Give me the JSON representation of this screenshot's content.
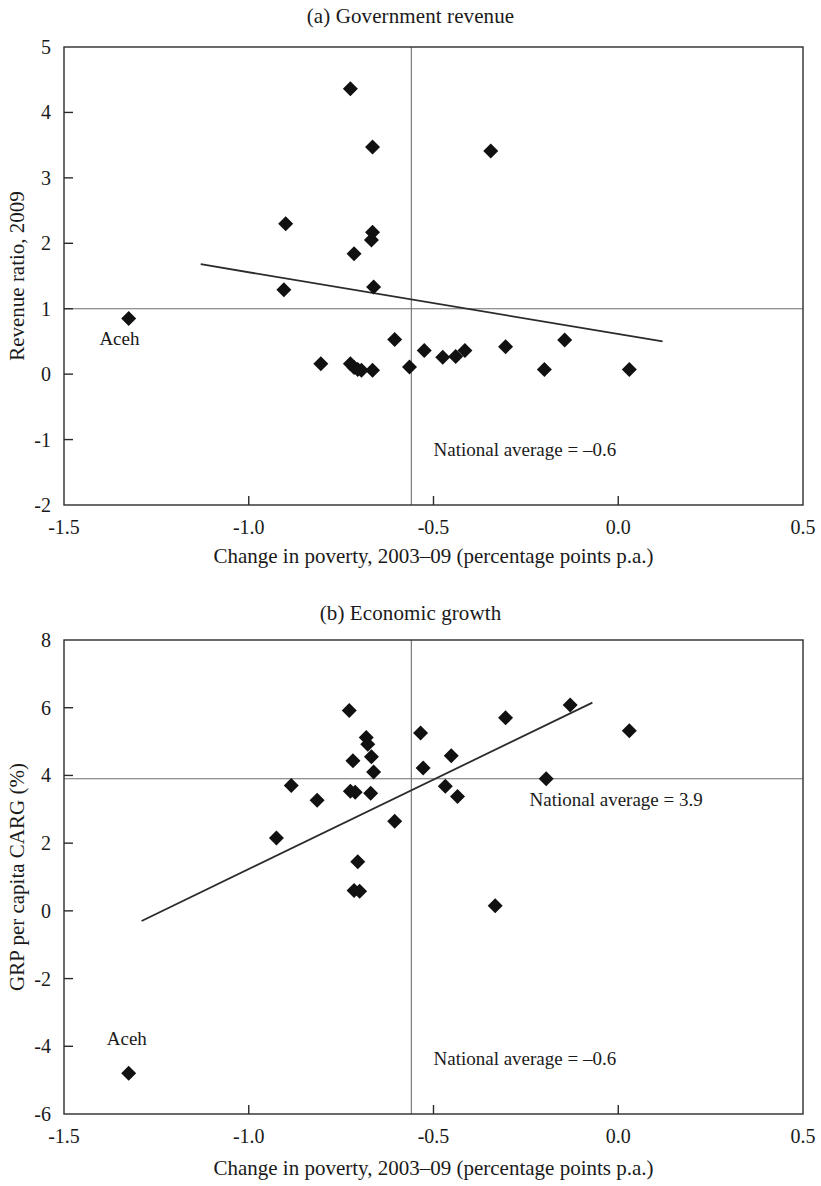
{
  "figure": {
    "panels": [
      {
        "key": "a",
        "title": "(a) Government revenue",
        "aceh_label": "Aceh",
        "vline_annotation": "National average = –0.6",
        "hline_annotation": ""
      },
      {
        "key": "b",
        "title": "(b) Economic growth",
        "aceh_label": "Aceh",
        "vline_annotation": "National average = –0.6",
        "hline_annotation": "National average = 3.9"
      }
    ]
  },
  "chart_data": [
    {
      "type": "scatter",
      "panel": "a",
      "title": "(a) Government revenue",
      "xlabel": "Change in poverty, 2003–09 (percentage points p.a.)",
      "ylabel": "Revenue ratio, 2009",
      "xlim": [
        -1.5,
        0.5
      ],
      "ylim": [
        -2,
        5
      ],
      "xticks": [
        -1.5,
        -1.0,
        -0.5,
        0.0,
        0.5
      ],
      "xticklabels": [
        "-1.5",
        "-1.0",
        "-0.5",
        "0.0",
        "0.5"
      ],
      "yticks": [
        -2,
        -1,
        0,
        1,
        2,
        3,
        4,
        5
      ],
      "yticklabels": [
        "-2",
        "-1",
        "0",
        "1",
        "2",
        "3",
        "4",
        "5"
      ],
      "grid": false,
      "legend": null,
      "hline": {
        "value": 1.0,
        "label": ""
      },
      "vline": {
        "value": -0.56,
        "label": "National average = –0.6"
      },
      "trendline": {
        "x": [
          -1.13,
          0.12
        ],
        "y": [
          1.68,
          0.5
        ]
      },
      "annotations": [
        {
          "text": "National average = –0.6",
          "x": -0.5,
          "y": -1.25
        },
        {
          "text": "Aceh",
          "x": -1.35,
          "y": 0.45
        }
      ],
      "points": [
        {
          "x": -1.325,
          "y": 0.85,
          "label": "Aceh"
        },
        {
          "x": -0.9,
          "y": 2.3,
          "label": ""
        },
        {
          "x": -0.905,
          "y": 1.29,
          "label": ""
        },
        {
          "x": -0.805,
          "y": 0.16,
          "label": ""
        },
        {
          "x": -0.725,
          "y": 4.36,
          "label": ""
        },
        {
          "x": -0.715,
          "y": 1.84,
          "label": ""
        },
        {
          "x": -0.725,
          "y": 0.16,
          "label": ""
        },
        {
          "x": -0.715,
          "y": 0.1,
          "label": ""
        },
        {
          "x": -0.705,
          "y": 0.07,
          "label": ""
        },
        {
          "x": -0.695,
          "y": 0.06,
          "label": ""
        },
        {
          "x": -0.665,
          "y": 3.47,
          "label": ""
        },
        {
          "x": -0.665,
          "y": 2.17,
          "label": ""
        },
        {
          "x": -0.668,
          "y": 2.05,
          "label": ""
        },
        {
          "x": -0.662,
          "y": 1.33,
          "label": ""
        },
        {
          "x": -0.665,
          "y": 0.06,
          "label": ""
        },
        {
          "x": -0.605,
          "y": 0.53,
          "label": ""
        },
        {
          "x": -0.565,
          "y": 0.11,
          "label": ""
        },
        {
          "x": -0.525,
          "y": 0.36,
          "label": ""
        },
        {
          "x": -0.475,
          "y": 0.26,
          "label": ""
        },
        {
          "x": -0.44,
          "y": 0.27,
          "label": ""
        },
        {
          "x": -0.415,
          "y": 0.36,
          "label": ""
        },
        {
          "x": -0.345,
          "y": 3.41,
          "label": ""
        },
        {
          "x": -0.305,
          "y": 0.42,
          "label": ""
        },
        {
          "x": -0.2,
          "y": 0.07,
          "label": ""
        },
        {
          "x": -0.145,
          "y": 0.52,
          "label": ""
        },
        {
          "x": 0.03,
          "y": 0.07,
          "label": ""
        }
      ]
    },
    {
      "type": "scatter",
      "panel": "b",
      "title": "(b) Economic growth",
      "xlabel": "Change in poverty, 2003–09 (percentage points p.a.)",
      "ylabel": "GRP per capita CARG (%)",
      "xlim": [
        -1.5,
        0.5
      ],
      "ylim": [
        -6,
        8
      ],
      "xticks": [
        -1.5,
        -1.0,
        -0.5,
        0.0,
        0.5
      ],
      "xticklabels": [
        "-1.5",
        "-1.0",
        "-0.5",
        "0.0",
        "0.5"
      ],
      "yticks": [
        -6,
        -4,
        -2,
        0,
        2,
        4,
        6,
        8
      ],
      "yticklabels": [
        "-6",
        "-4",
        "-2",
        "0",
        "2",
        "4",
        "6",
        "8"
      ],
      "grid": false,
      "legend": null,
      "hline": {
        "value": 3.9,
        "label": "National average = 3.9"
      },
      "vline": {
        "value": -0.56,
        "label": "National average = –0.6"
      },
      "trendline": {
        "x": [
          -1.29,
          -0.07
        ],
        "y": [
          -0.3,
          6.15
        ]
      },
      "annotations": [
        {
          "text": "National average = 3.9",
          "x": -0.24,
          "y": 3.1
        },
        {
          "text": "National average = –0.6",
          "x": -0.5,
          "y": -4.55
        },
        {
          "text": "Aceh",
          "x": -1.33,
          "y": -3.95
        }
      ],
      "points": [
        {
          "x": -1.325,
          "y": -4.8,
          "label": "Aceh"
        },
        {
          "x": -0.925,
          "y": 2.15,
          "label": ""
        },
        {
          "x": -0.885,
          "y": 3.7,
          "label": ""
        },
        {
          "x": -0.815,
          "y": 3.27,
          "label": ""
        },
        {
          "x": -0.728,
          "y": 5.92,
          "label": ""
        },
        {
          "x": -0.718,
          "y": 4.43,
          "label": ""
        },
        {
          "x": -0.725,
          "y": 3.53,
          "label": ""
        },
        {
          "x": -0.712,
          "y": 3.5,
          "label": ""
        },
        {
          "x": -0.705,
          "y": 1.45,
          "label": ""
        },
        {
          "x": -0.715,
          "y": 0.6,
          "label": ""
        },
        {
          "x": -0.7,
          "y": 0.58,
          "label": ""
        },
        {
          "x": -0.682,
          "y": 5.12,
          "label": ""
        },
        {
          "x": -0.678,
          "y": 4.92,
          "label": ""
        },
        {
          "x": -0.668,
          "y": 4.55,
          "label": ""
        },
        {
          "x": -0.662,
          "y": 4.1,
          "label": ""
        },
        {
          "x": -0.67,
          "y": 3.47,
          "label": ""
        },
        {
          "x": -0.605,
          "y": 2.65,
          "label": ""
        },
        {
          "x": -0.535,
          "y": 5.25,
          "label": ""
        },
        {
          "x": -0.528,
          "y": 4.22,
          "label": ""
        },
        {
          "x": -0.468,
          "y": 3.68,
          "label": ""
        },
        {
          "x": -0.452,
          "y": 4.58,
          "label": ""
        },
        {
          "x": -0.435,
          "y": 3.38,
          "label": ""
        },
        {
          "x": -0.333,
          "y": 0.15,
          "label": ""
        },
        {
          "x": -0.305,
          "y": 5.7,
          "label": ""
        },
        {
          "x": -0.195,
          "y": 3.9,
          "label": ""
        },
        {
          "x": -0.13,
          "y": 6.08,
          "label": ""
        },
        {
          "x": 0.03,
          "y": 5.32,
          "label": ""
        }
      ]
    }
  ]
}
